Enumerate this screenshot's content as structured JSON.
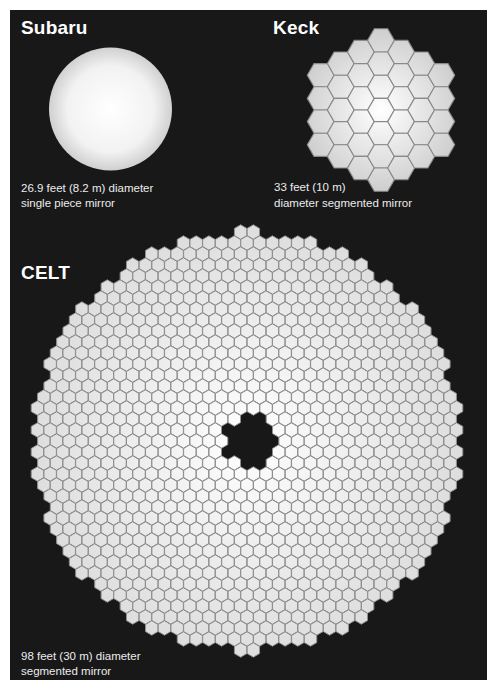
{
  "colors": {
    "background": "#181818",
    "page": "#ffffff",
    "mirror_center": "#ffffff",
    "mirror_edge": "#c8c8c8",
    "segment_border": "#8a8a8a",
    "text": "#ffffff"
  },
  "telescopes": {
    "subaru": {
      "name": "Subaru",
      "caption_line1": "26.9 feet (8.2 m) diameter",
      "caption_line2": "single piece mirror",
      "mirror_type": "single piece",
      "diameter_ft": 26.9,
      "diameter_m": 8.2
    },
    "keck": {
      "name": "Keck",
      "caption_line1": "33 feet (10 m)",
      "caption_line2": "diameter segmented mirror",
      "mirror_type": "segmented",
      "diameter_ft": 33,
      "diameter_m": 10,
      "column_heights": [
        4,
        5,
        6,
        7,
        6,
        5,
        4
      ]
    },
    "celt": {
      "name": "CELT",
      "caption_line1": "98 feet (30 m) diameter",
      "caption_line2": "segmented mirror",
      "mirror_type": "segmented",
      "diameter_ft": 98,
      "diameter_m": 30
    }
  }
}
